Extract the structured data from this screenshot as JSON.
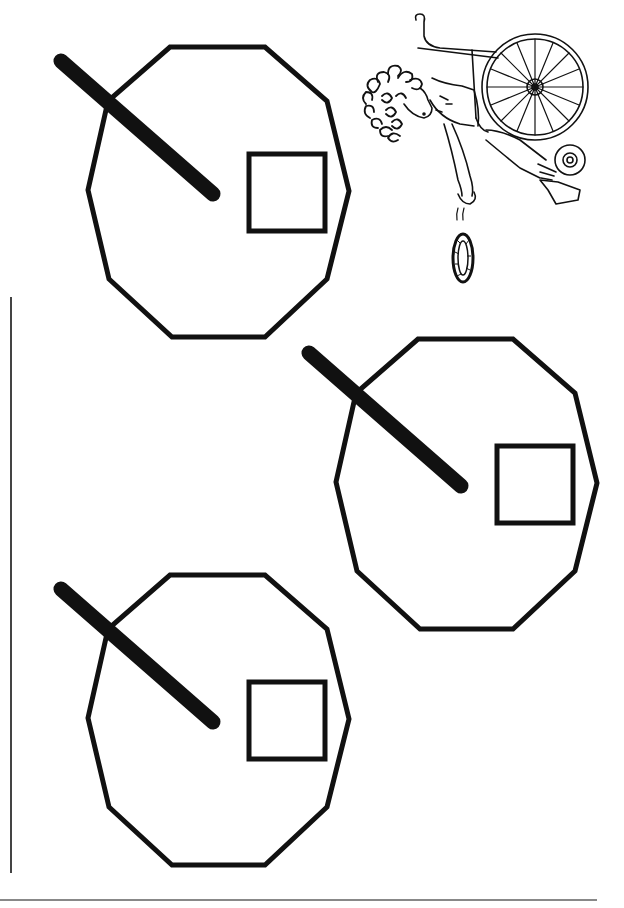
{
  "page": {
    "background": "#ffffff",
    "ink_color": "#111111",
    "rule_color": "#555555"
  },
  "illustration": {
    "subject": "girl-in-wheelchair-tossing-ring",
    "ring_icon": "ring-toss-icon"
  },
  "targets": [
    {
      "id": "target-1",
      "offset_x": 0,
      "offset_y": 0
    },
    {
      "id": "target-2",
      "offset_x": 248,
      "offset_y": 292
    },
    {
      "id": "target-3",
      "offset_x": 0,
      "offset_y": 528
    }
  ],
  "rules": {
    "left_line": {
      "x": 11,
      "y1": 297,
      "y2": 873
    },
    "bottom_line": {
      "x1": 0,
      "x2": 597,
      "y": 900
    }
  }
}
